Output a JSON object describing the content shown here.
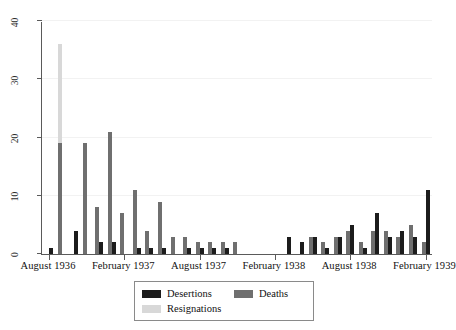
{
  "chart_data": {
    "type": "bar",
    "title": "",
    "xlabel": "",
    "ylabel": "",
    "ylim": [
      0,
      40
    ],
    "yticks": [
      0,
      10,
      20,
      30,
      40
    ],
    "grid": true,
    "legend_position": "bottom-center",
    "bar_mode": "grouped",
    "x_tick_labels": [
      "August 1936",
      "February 1937",
      "August 1937",
      "February 1938",
      "August 1938",
      "February 1939"
    ],
    "x_tick_months": [
      "1936-08",
      "1937-02",
      "1937-08",
      "1938-02",
      "1938-08",
      "1939-02"
    ],
    "categories": [
      "1936-08",
      "1936-09",
      "1936-10",
      "1936-11",
      "1936-12",
      "1937-01",
      "1937-02",
      "1937-03",
      "1937-04",
      "1937-05",
      "1937-06",
      "1937-07",
      "1937-08",
      "1937-09",
      "1937-10",
      "1937-11",
      "1937-12",
      "1938-01",
      "1938-02",
      "1938-03",
      "1938-04",
      "1938-05",
      "1938-06",
      "1938-07",
      "1938-08",
      "1938-09",
      "1938-10",
      "1938-11",
      "1938-12",
      "1939-01",
      "1939-02"
    ],
    "series": [
      {
        "name": "Desertions",
        "color": "#1c1c1c",
        "values": [
          1,
          0,
          4,
          0,
          2,
          2,
          0,
          1,
          1,
          1,
          0,
          1,
          1,
          1,
          1,
          0,
          0,
          0,
          0,
          3,
          2,
          3,
          1,
          3,
          5,
          1,
          7,
          3,
          4,
          3,
          11
        ]
      },
      {
        "name": "Deaths",
        "color": "#6f6f6f",
        "values": [
          0,
          19,
          0,
          19,
          8,
          21,
          7,
          11,
          4,
          9,
          3,
          3,
          2,
          2,
          2,
          2,
          0,
          0,
          0,
          0,
          0,
          3,
          2,
          3,
          4,
          2,
          4,
          4,
          3,
          5,
          2
        ]
      },
      {
        "name": "Resignations",
        "color": "#d8d8d8",
        "values": [
          0,
          36,
          0,
          0,
          0,
          0,
          0,
          0,
          0,
          0,
          0,
          0,
          0,
          0,
          0,
          0,
          0,
          0,
          0,
          0,
          0,
          0,
          0,
          0,
          0,
          0,
          0,
          0,
          0,
          0,
          0
        ]
      }
    ]
  },
  "legend": {
    "items": [
      {
        "label": "Desertions",
        "swatch": "desertions"
      },
      {
        "label": "Deaths",
        "swatch": "deaths"
      },
      {
        "label": "Resignations",
        "swatch": "resignations"
      }
    ]
  }
}
